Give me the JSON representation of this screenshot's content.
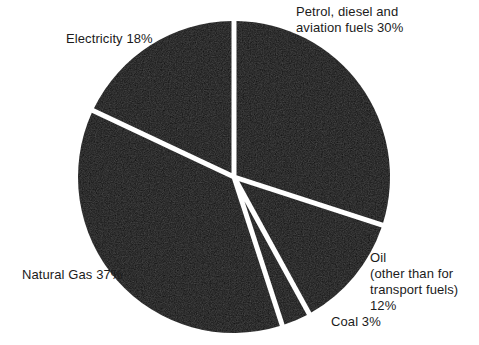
{
  "chart_data": {
    "type": "pie",
    "title": "",
    "subtitle": "",
    "xlabel": "",
    "ylabel": "",
    "legend_position": "none",
    "grid": false,
    "start_angle_deg": 0,
    "direction": "clockwise",
    "exploded": false,
    "categories": [
      "Petrol, diesel and aviation fuels",
      "Oil (other than for transport fuels)",
      "Coal",
      "Natural Gas",
      "Electricity"
    ],
    "values": [
      30,
      12,
      3,
      37,
      18
    ],
    "units": "%",
    "total": 100,
    "slices": [
      {
        "name": "petrol-diesel-aviation-fuels",
        "label_lines": [
          "Petrol, diesel and",
          "aviation fuels 30%"
        ],
        "label_text": "Petrol, diesel and\naviation fuels 30%",
        "value": 30,
        "value_text": "30%",
        "start_deg": 0,
        "end_deg": 108,
        "color": "#0d0d0d"
      },
      {
        "name": "oil-other-than-transport-fuels",
        "label_lines": [
          "Oil",
          "(other than for",
          "transport fuels)",
          "12%"
        ],
        "label_text": "Oil\n(other than for\ntransport fuels)\n12%",
        "value": 12,
        "value_text": "12%",
        "start_deg": 108,
        "end_deg": 151.2,
        "color": "#0d0d0d"
      },
      {
        "name": "coal",
        "label_lines": [
          "Coal 3%"
        ],
        "label_text": "Coal 3%",
        "value": 3,
        "value_text": "3%",
        "start_deg": 151.2,
        "end_deg": 162,
        "color": "#0d0d0d"
      },
      {
        "name": "natural-gas",
        "label_lines": [
          "Natural Gas 37%"
        ],
        "label_text": "Natural Gas 37%",
        "value": 37,
        "value_text": "37%",
        "start_deg": 162,
        "end_deg": 295.2,
        "color": "#0d0d0d"
      },
      {
        "name": "electricity",
        "label_lines": [
          "Electricity 18%"
        ],
        "label_text": "Electricity 18%",
        "value": 18,
        "value_text": "18%",
        "start_deg": 295.2,
        "end_deg": 360,
        "color": "#0d0d0d"
      }
    ],
    "colors": {
      "slice_fill": "#0d0d0d",
      "background": "#ffffff",
      "separator": "#ffffff",
      "label_text": "#1b1b1b"
    },
    "geometry": {
      "center_x": 234,
      "center_y": 177,
      "radius": 156,
      "gap_px": 5
    }
  }
}
